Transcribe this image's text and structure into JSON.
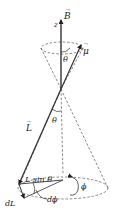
{
  "diagram": {
    "labels": {
      "field": "B",
      "axis": "z",
      "moment": "μ",
      "angular_momentum": "L",
      "theta_top": "θ",
      "theta_mid": "θ",
      "radius": "L sin θ",
      "phi": "ϕ",
      "dphi": "dϕ",
      "dL": "dL"
    },
    "colors": {
      "stroke": "#333333",
      "dashed": "#555555",
      "text": "#222222"
    }
  }
}
